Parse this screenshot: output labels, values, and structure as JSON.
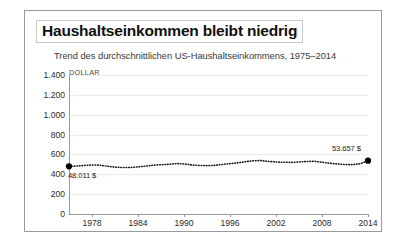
{
  "header": {
    "title": "Haushaltseinkommen bleibt niedrig",
    "subtitle": "Trend des durchschnittlichen US-Haushaltseinkommens, 1975–2014"
  },
  "chart_data": {
    "type": "line",
    "title": "Haushaltseinkommen bleibt niedrig",
    "subtitle": "Trend des durchschnittlichen US-Haushaltseinkommens, 1975–2014",
    "xlabel": "",
    "ylabel": "DOLLAR",
    "unit_label": "DOLLAR",
    "grid": true,
    "legend": "none",
    "ylim": [
      0,
      1400
    ],
    "yticks": [
      0,
      200,
      400,
      600,
      800,
      1000,
      1200,
      1400
    ],
    "ytick_labels": [
      "0",
      "200",
      "400",
      "600",
      "800",
      "1.000",
      "1.200",
      "1.400"
    ],
    "xlim": [
      1975,
      2014
    ],
    "xticks": [
      1978,
      1984,
      1990,
      1996,
      2002,
      2008,
      2014
    ],
    "xtick_labels": [
      "1978",
      "1984",
      "1990",
      "1996",
      "2002",
      "2008",
      "2014"
    ],
    "value_scale_note": "Werte in Hundert Dollar dargestellt",
    "x": [
      1975,
      1976,
      1977,
      1978,
      1979,
      1980,
      1981,
      1982,
      1983,
      1984,
      1985,
      1986,
      1987,
      1988,
      1989,
      1990,
      1991,
      1992,
      1993,
      1994,
      1995,
      1996,
      1997,
      1998,
      1999,
      2000,
      2001,
      2002,
      2003,
      2004,
      2005,
      2006,
      2007,
      2008,
      2009,
      2010,
      2011,
      2012,
      2013,
      2014
    ],
    "values": [
      480,
      483,
      489,
      494,
      492,
      481,
      472,
      468,
      468,
      474,
      482,
      492,
      496,
      500,
      508,
      504,
      494,
      489,
      487,
      490,
      499,
      507,
      515,
      527,
      536,
      538,
      530,
      524,
      521,
      520,
      524,
      529,
      531,
      521,
      511,
      504,
      498,
      497,
      507,
      537
    ],
    "series": [
      {
        "name": "Durchschnittliches US-Haushaltseinkommen",
        "values": [
          480,
          483,
          489,
          494,
          492,
          481,
          472,
          468,
          468,
          474,
          482,
          492,
          496,
          500,
          508,
          504,
          494,
          489,
          487,
          490,
          499,
          507,
          515,
          527,
          536,
          538,
          530,
          524,
          521,
          520,
          524,
          529,
          531,
          521,
          511,
          504,
          498,
          497,
          507,
          537
        ]
      }
    ],
    "annotations": [
      {
        "name": "start-value",
        "x": 1975,
        "value": 480,
        "label": "48.011 $"
      },
      {
        "name": "end-value",
        "x": 2014,
        "value": 537,
        "label": "53.657 $"
      }
    ],
    "colors": {
      "line": "#1a1a1a",
      "marker": "#000000",
      "grid": "#ececec",
      "axis": "#9a9a9a",
      "background": "#ffffff"
    }
  }
}
